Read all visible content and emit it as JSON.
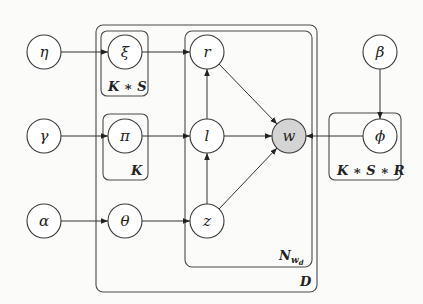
{
  "diagram": {
    "type": "plate-notation graphical model",
    "nodes": {
      "eta": {
        "label": "η",
        "observed": false
      },
      "xi": {
        "label": "ξ",
        "observed": false
      },
      "r": {
        "label": "r",
        "observed": false
      },
      "beta": {
        "label": "β",
        "observed": false
      },
      "gamma": {
        "label": "γ",
        "observed": false
      },
      "pi": {
        "label": "π",
        "observed": false
      },
      "l": {
        "label": "l",
        "observed": false
      },
      "w": {
        "label": "w",
        "observed": true
      },
      "phi": {
        "label": "ϕ",
        "observed": false
      },
      "alpha": {
        "label": "α",
        "observed": false
      },
      "theta": {
        "label": "θ",
        "observed": false
      },
      "z": {
        "label": "z",
        "observed": false
      }
    },
    "plates": {
      "ks": {
        "label": "K ∗ S"
      },
      "k": {
        "label": "K"
      },
      "ksr": {
        "label": "K ∗ S ∗ R"
      },
      "nwd": {
        "label": "N",
        "sub": "w",
        "subsub": "d"
      },
      "d": {
        "label": "D"
      }
    },
    "edges": [
      [
        "eta",
        "xi"
      ],
      [
        "xi",
        "r"
      ],
      [
        "gamma",
        "pi"
      ],
      [
        "pi",
        "l"
      ],
      [
        "alpha",
        "theta"
      ],
      [
        "theta",
        "z"
      ],
      [
        "l",
        "r"
      ],
      [
        "z",
        "l"
      ],
      [
        "r",
        "w"
      ],
      [
        "l",
        "w"
      ],
      [
        "z",
        "w"
      ],
      [
        "beta",
        "phi"
      ],
      [
        "phi",
        "w"
      ]
    ],
    "colors": {
      "observed_fill": "#d4d4d4",
      "stroke": "#3a3a3a"
    }
  }
}
